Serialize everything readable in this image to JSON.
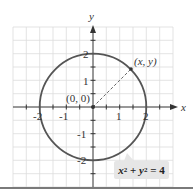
{
  "figure": {
    "axes": {
      "x_label": "x",
      "y_label": "y",
      "x_ticks": [
        "-2",
        "-1",
        "1",
        "2"
      ],
      "y_ticks": [
        "2",
        "1",
        "-1",
        "-2"
      ]
    },
    "origin_label": "(0, 0)",
    "point_label": "(x, y)",
    "equation": {
      "x_var": "x",
      "y_var": "y",
      "exp": "2",
      "plus": " + ",
      "eq": " = 4"
    },
    "circle": {
      "center": [
        0,
        0
      ],
      "radius": 2,
      "color": "#555555"
    },
    "colors": {
      "grid": "#dddddd",
      "axis": "#333333",
      "label_bg": "#e6e6e6"
    }
  }
}
